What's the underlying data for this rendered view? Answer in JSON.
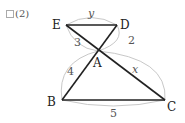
{
  "problem": {
    "number": "(2)"
  },
  "points": {
    "E": {
      "label": "E",
      "x": 66,
      "y": 25
    },
    "D": {
      "label": "D",
      "x": 117,
      "y": 25
    },
    "A": {
      "label": "A",
      "x": 98,
      "y": 51
    },
    "B": {
      "label": "B",
      "x": 62,
      "y": 100
    },
    "C": {
      "label": "C",
      "x": 165,
      "y": 100
    }
  },
  "lengths": {
    "ED": "y",
    "AD": "2",
    "EA": "3",
    "AB": "4",
    "AC": "x",
    "BC": "5"
  },
  "colors": {
    "line": "#222222",
    "arc": "#c8c8c8",
    "text": "#555555"
  }
}
